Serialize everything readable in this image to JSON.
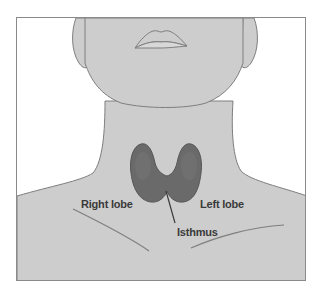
{
  "diagram": {
    "labels": {
      "right_lobe": "Right lobe",
      "left_lobe": "Left lobe",
      "isthmus": "Isthmus"
    },
    "colors": {
      "skin": "#cdcdcd",
      "outline": "#7e7e7e",
      "thyroid": "#6a6a6a",
      "thyroid_dark": "#4e4e4e",
      "label_text": "#3a3a3a",
      "background": "#ffffff"
    }
  }
}
